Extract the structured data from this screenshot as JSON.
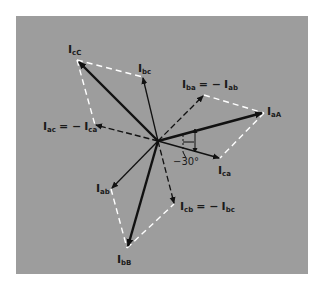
{
  "diagram": {
    "title": "",
    "background_color": "#9d9d9d",
    "line_color": "#111111",
    "dashed_guide_color": "#ffffff",
    "origin": {
      "x": 158,
      "y": 141
    },
    "phasors": [
      {
        "id": "IaA",
        "label_main": "I",
        "label_sub": "aA",
        "style": "bold",
        "to": {
          "x": 264,
          "y": 113
        },
        "label_pos": {
          "x": 268,
          "y": 117
        }
      },
      {
        "id": "IbB",
        "label_main": "I",
        "label_sub": "bB",
        "style": "bold",
        "to": {
          "x": 127,
          "y": 248
        },
        "label_pos": {
          "x": 117,
          "y": 264
        }
      },
      {
        "id": "IcC",
        "label_main": "I",
        "label_sub": "cC",
        "style": "bold",
        "to": {
          "x": 77,
          "y": 60
        },
        "label_pos": {
          "x": 68,
          "y": 54
        }
      },
      {
        "id": "Ibc",
        "label_main": "I",
        "label_sub": "bc",
        "style": "thin",
        "to": {
          "x": 143,
          "y": 77
        },
        "label_pos": {
          "x": 138,
          "y": 72
        }
      },
      {
        "id": "Iab",
        "label_main": "I",
        "label_sub": "ab",
        "style": "thin",
        "to": {
          "x": 111,
          "y": 189
        },
        "label_pos": {
          "x": 96,
          "y": 190
        }
      },
      {
        "id": "Ica",
        "label_main": "I",
        "label_sub": "ca",
        "style": "thin",
        "to": {
          "x": 220,
          "y": 158
        },
        "label_pos": {
          "x": 218,
          "y": 174
        }
      },
      {
        "id": "Iba",
        "label_main": "I",
        "label_sub": "ba",
        "style": "dashed",
        "to": {
          "x": 204,
          "y": 95
        }
      },
      {
        "id": "Iac",
        "label_main": "I",
        "label_sub": "ac",
        "style": "dashed",
        "to": {
          "x": 95,
          "y": 125
        }
      },
      {
        "id": "Icb",
        "label_main": "I",
        "label_sub": "cb",
        "style": "dashed",
        "to": {
          "x": 174,
          "y": 204
        }
      }
    ],
    "equation_labels": [
      {
        "text": "I_ba = − I_ab",
        "lhs_main": "I",
        "lhs_sub": "ba",
        "rhs_main": "I",
        "rhs_sub": "ab",
        "op": "= −",
        "pos": {
          "x": 182,
          "y": 88
        }
      },
      {
        "text": "I_ac = − I_ca",
        "lhs_main": "I",
        "lhs_sub": "ac",
        "rhs_main": "I",
        "rhs_sub": "ca",
        "op": "= −",
        "pos": {
          "x": 44,
          "y": 131
        }
      },
      {
        "text": "I_cb = − I_bc",
        "lhs_main": "I",
        "lhs_sub": "cb",
        "rhs_main": "I",
        "rhs_sub": "bc",
        "op": "= −",
        "pos": {
          "x": 180,
          "y": 211
        }
      }
    ],
    "angle_annotation": {
      "text": "−30°",
      "pos": {
        "x": 175,
        "y": 168
      }
    }
  }
}
